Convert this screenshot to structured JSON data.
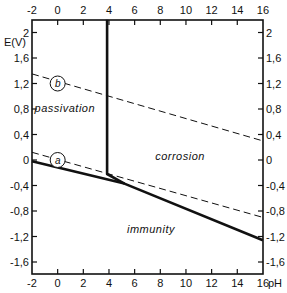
{
  "chart_data": {
    "type": "line",
    "title": "",
    "xlabel": "pH",
    "ylabel": "E(V)",
    "xlim": [
      -2,
      16
    ],
    "ylim": [
      -1.8,
      2.2
    ],
    "grid": false,
    "x_ticks": [
      -2,
      0,
      2,
      4,
      6,
      8,
      10,
      12,
      14,
      16
    ],
    "x_tick_labels": [
      "-2",
      "0",
      "2",
      "4",
      "6",
      "8",
      "10",
      "12",
      "14",
      "16"
    ],
    "y_ticks": [
      2,
      1.6,
      1.2,
      0.8,
      0.4,
      0,
      -0.4,
      -0.8,
      -1.2,
      -1.6
    ],
    "y_tick_labels": [
      "2",
      "1,6",
      "1,2",
      "0,8",
      "0,4",
      "0",
      "-0,4",
      "-0,8",
      "-1,2",
      "-1,6"
    ],
    "series": [
      {
        "name": "boundary (solid)",
        "style": "solid",
        "points": [
          [
            -2,
            -0.02
          ],
          [
            5.2,
            -0.37
          ],
          [
            16,
            -1.26
          ]
        ]
      },
      {
        "name": "vertical boundary (solid)",
        "style": "solid",
        "points": [
          [
            3.85,
            2.2
          ],
          [
            3.85,
            -0.22
          ],
          [
            5.2,
            -0.37
          ]
        ]
      },
      {
        "name": "a",
        "style": "dashed",
        "points": [
          [
            -2,
            0.12
          ],
          [
            16,
            -0.9
          ]
        ]
      },
      {
        "name": "b",
        "style": "dashed",
        "points": [
          [
            -2,
            1.35
          ],
          [
            16,
            0.3
          ]
        ]
      }
    ],
    "line_tags": [
      {
        "label": "a",
        "x": 0.0,
        "y": 0.0
      },
      {
        "label": "b",
        "x": 0.0,
        "y": 1.2
      }
    ],
    "annotations": [
      {
        "text": "passivation",
        "x": -1.8,
        "y": 0.75
      },
      {
        "text": "corrosion",
        "x": 7.6,
        "y": 0.0
      },
      {
        "text": "immunity",
        "x": 5.4,
        "y": -1.15
      }
    ]
  },
  "axes": {
    "x_unit_label": "pH",
    "y_unit_label": "E(V)"
  }
}
